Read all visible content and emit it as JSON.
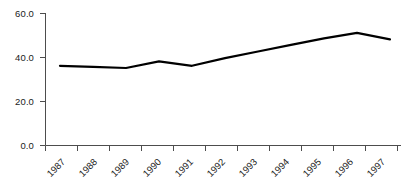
{
  "chart_data": {
    "type": "line",
    "title": "",
    "subtitle": "",
    "xlabel": "",
    "ylabel": "",
    "categories": [
      "1987",
      "1988",
      "1989",
      "1990",
      "1991",
      "1992",
      "1993",
      "1994",
      "1995",
      "1996",
      "1997"
    ],
    "values": [
      36.0,
      35.5,
      35.0,
      38.0,
      36.0,
      39.5,
      42.5,
      45.5,
      48.5,
      51.0,
      48.0
    ],
    "series": [
      {
        "name": "",
        "values": [
          36.0,
          35.5,
          35.0,
          38.0,
          36.0,
          39.5,
          42.5,
          45.5,
          48.5,
          51.0,
          48.0
        ]
      }
    ],
    "ylim": [
      0.0,
      60.0
    ],
    "yticks": [
      0.0,
      20.0,
      40.0,
      60.0
    ],
    "ytick_labels": [
      "0.0",
      "20.0",
      "40.0",
      "60.0"
    ],
    "xtick_labels": [
      "1987",
      "1988",
      "1989",
      "1990",
      "1991",
      "1992",
      "1993",
      "1994",
      "1995",
      "1996",
      "1997"
    ],
    "grid": false,
    "legend": "none",
    "line_color": "#000000",
    "line_width": 2.2,
    "axis_color": "#4d4d4d",
    "background_color": "#ffffff",
    "xtick_rotation": -45
  },
  "axes": {
    "y_labels": [
      "60.0",
      "40.0",
      "20.0",
      "0.0"
    ],
    "x_labels": [
      "1987",
      "1988",
      "1989",
      "1990",
      "1991",
      "1992",
      "1993",
      "1994",
      "1995",
      "1996",
      "1997"
    ]
  }
}
